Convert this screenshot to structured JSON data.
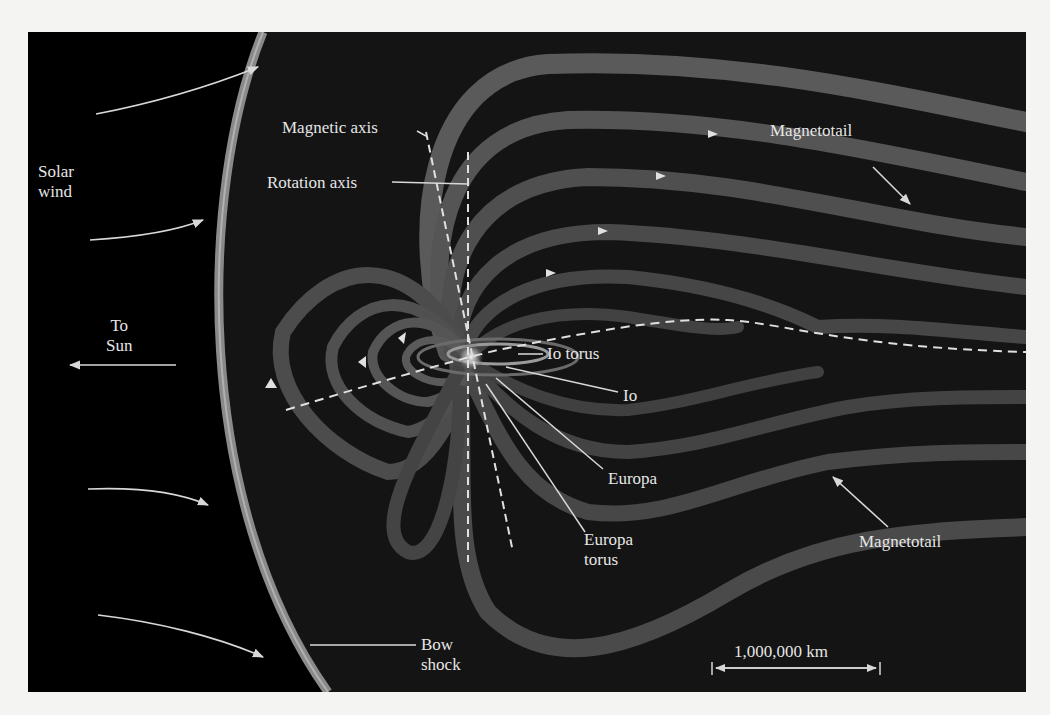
{
  "figure": {
    "colors": {
      "background": "#000000",
      "page": "#f4f4f2",
      "field_band": "#4a4a4a",
      "bow_shock": "#8a8a8a",
      "labels": "#e6e6e6",
      "leader_lines": "#d8d8d8"
    },
    "labels": {
      "solar_wind": [
        "Solar",
        "wind"
      ],
      "to_sun": [
        "To",
        "Sun"
      ],
      "magnetic_axis": "Magnetic axis",
      "rotation_axis": "Rotation axis",
      "magnetotail_top": "Magnetotail",
      "magnetotail_bottom": "Magnetotail",
      "io_torus": "Io torus",
      "io": "Io",
      "europa": "Europa",
      "europa_torus": [
        "Europa",
        "torus"
      ],
      "bow_shock": [
        "Bow",
        "shock"
      ],
      "scale_bar": "1,000,000 km"
    },
    "arrows": {
      "solar_wind_count": 5,
      "to_sun_direction": "left"
    }
  }
}
